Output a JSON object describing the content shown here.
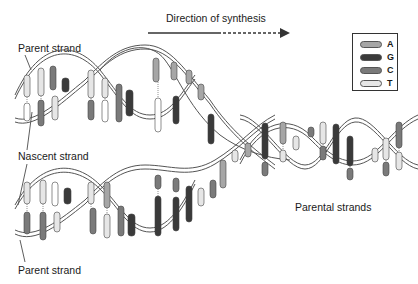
{
  "direction": {
    "label": "Direction of synthesis",
    "arrow": "solid-then-dashed-arrow-right"
  },
  "labels": {
    "parent_strand_top": "Parent strand",
    "nascent_strand": "Nascent strand",
    "parent_strand_bottom": "Parent strand",
    "parental_strands": "Parental strands"
  },
  "legend": {
    "items": [
      {
        "base": "A",
        "color": "#a6a6a6"
      },
      {
        "base": "G",
        "color": "#3a3a3a"
      },
      {
        "base": "C",
        "color": "#7a7a7a"
      },
      {
        "base": "T",
        "color": "#e6e6e6"
      }
    ]
  },
  "colors": {
    "backbone_stroke": "#555555",
    "backbone_fill": "#ffffff",
    "dotted_bond": "#777777"
  }
}
